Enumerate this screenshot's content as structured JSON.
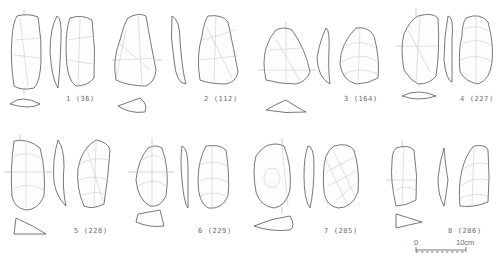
{
  "figure": {
    "artifacts": [
      {
        "number": "1",
        "id": "36",
        "label": "1 (36)"
      },
      {
        "number": "2",
        "id": "112",
        "label": "2 (112)"
      },
      {
        "number": "3",
        "id": "164",
        "label": "3 (164)"
      },
      {
        "number": "4",
        "id": "227",
        "label": "4 (227)"
      },
      {
        "number": "5",
        "id": "228",
        "label": "5 (228)"
      },
      {
        "number": "6",
        "id": "229",
        "label": "6 (229)"
      },
      {
        "number": "7",
        "id": "285",
        "label": "7 (285)"
      },
      {
        "number": "8",
        "id": "286",
        "label": "8 (286)"
      }
    ],
    "scale_bar": {
      "start_label": "0",
      "end_label": "10cm"
    }
  }
}
